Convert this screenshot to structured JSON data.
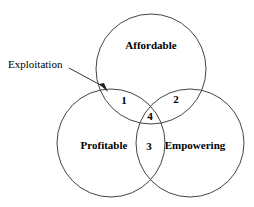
{
  "figure": {
    "type": "venn-diagram-3-set",
    "background_color": "#ffffff",
    "stroke_color": "#444444",
    "text_color": "#000000"
  },
  "sets": [
    {
      "id": "affordable",
      "label": "Affordable",
      "cx": 151,
      "cy": 69,
      "r": 55,
      "label_x": 151,
      "label_y": 46
    },
    {
      "id": "profitable",
      "label": "Profitable",
      "cx": 111,
      "cy": 143,
      "r": 54,
      "label_x": 104,
      "label_y": 146
    },
    {
      "id": "empowering",
      "label": "Empowering",
      "cx": 190,
      "cy": 143,
      "r": 54,
      "label_x": 195,
      "label_y": 146
    }
  ],
  "regions": [
    {
      "id": "region-1",
      "number": "1",
      "x": 124,
      "y": 101,
      "intersection": "Affordable ∩ Profitable"
    },
    {
      "id": "region-2",
      "number": "2",
      "x": 176,
      "y": 100,
      "intersection": "Affordable ∩ Empowering"
    },
    {
      "id": "region-3",
      "number": "3",
      "x": 149,
      "y": 147,
      "intersection": "Profitable ∩ Empowering"
    },
    {
      "id": "region-4",
      "number": "4",
      "x": 150,
      "y": 117,
      "intersection": "Affordable ∩ Profitable ∩ Empowering"
    }
  ],
  "annotation": {
    "label": "Exploitation",
    "label_x": 8,
    "label_y": 65,
    "line_start_x": 69,
    "line_start_y": 68,
    "line_end_x": 106,
    "line_end_y": 88,
    "arrow_points": "108,92 99,84 104,83"
  }
}
